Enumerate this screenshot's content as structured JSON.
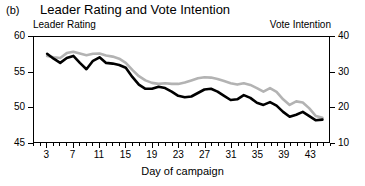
{
  "panel_label": "(b)",
  "title": "Leader Rating and Vote Intention",
  "left_axis_header": "Leader Rating",
  "right_axis_header": "Vote Intention",
  "chart_data": {
    "type": "line",
    "title": "Leader Rating and Vote Intention",
    "xlabel": "Day of campaign",
    "ylabel": "Leader Rating",
    "y2label": "Vote Intention",
    "xlim": [
      1,
      46
    ],
    "ylim": [
      45,
      60
    ],
    "y2lim": [
      10,
      40
    ],
    "yticks": [
      45,
      50,
      55,
      60
    ],
    "y2ticks": [
      10,
      20,
      30,
      40
    ],
    "xticks": [
      3,
      7,
      11,
      15,
      19,
      23,
      27,
      31,
      35,
      39,
      43
    ],
    "xticklabels": [
      "3",
      "7",
      "11",
      "15",
      "19",
      "23",
      "27",
      "31",
      "35",
      "39",
      "43"
    ],
    "grid": false,
    "legend": "axis-headers",
    "colors": {
      "leader_rating": "#000000",
      "vote_intention": "#b3b3b3"
    },
    "x": [
      3,
      4,
      5,
      6,
      7,
      8,
      9,
      10,
      11,
      12,
      13,
      14,
      15,
      16,
      17,
      18,
      19,
      20,
      21,
      22,
      23,
      24,
      25,
      26,
      27,
      28,
      29,
      30,
      31,
      32,
      33,
      34,
      35,
      36,
      37,
      38,
      39,
      40,
      41,
      42,
      43,
      44,
      45
    ],
    "series": [
      {
        "name": "Leader Rating",
        "axis": "left",
        "color": "#000000",
        "values": [
          57.6,
          56.9,
          56.3,
          57.0,
          57.3,
          56.3,
          55.4,
          56.6,
          57.1,
          56.3,
          56.2,
          56.0,
          55.6,
          54.3,
          53.2,
          52.6,
          52.6,
          52.9,
          52.7,
          52.2,
          51.6,
          51.4,
          51.5,
          52.0,
          52.5,
          52.6,
          52.2,
          51.6,
          51.0,
          51.1,
          51.7,
          51.3,
          50.6,
          50.3,
          50.7,
          50.2,
          49.3,
          48.6,
          48.9,
          49.3,
          48.7,
          48.1,
          48.2
        ]
      },
      {
        "name": "Vote Intention",
        "axis": "right",
        "color": "#b3b3b3",
        "values": [
          34.6,
          34.2,
          34.0,
          35.4,
          35.8,
          35.3,
          34.8,
          35.2,
          35.3,
          34.7,
          34.4,
          33.8,
          32.6,
          30.6,
          28.8,
          27.6,
          26.9,
          26.6,
          26.8,
          26.6,
          26.6,
          27.0,
          27.6,
          28.2,
          28.5,
          28.4,
          28.0,
          27.4,
          26.8,
          26.4,
          26.8,
          26.3,
          25.4,
          24.4,
          25.4,
          24.3,
          22.2,
          20.6,
          21.6,
          21.3,
          19.6,
          17.4,
          16.9
        ]
      }
    ]
  }
}
